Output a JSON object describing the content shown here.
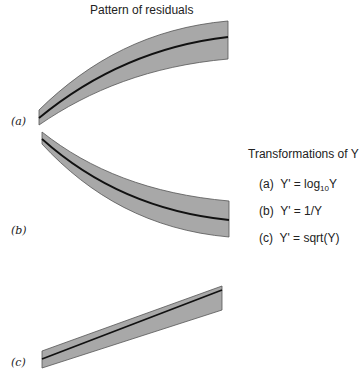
{
  "title": "Pattern of residuals",
  "panels": [
    {
      "id": "a",
      "label": "(a)",
      "shape": "concave-increasing band"
    },
    {
      "id": "b",
      "label": "(b)",
      "shape": "convex-decreasing band"
    },
    {
      "id": "c",
      "label": "(c)",
      "shape": "linear increasing widening band"
    }
  ],
  "transformations": {
    "title": "Transformations of Y",
    "items": [
      {
        "letter": "(a)",
        "lhs": "Y' = log",
        "sub": "10",
        "rhs": "Y"
      },
      {
        "letter": "(b)",
        "lhs": "Y' = 1/Y",
        "sub": "",
        "rhs": ""
      },
      {
        "letter": "(c)",
        "lhs": "Y' = sqrt(Y)",
        "sub": "",
        "rhs": ""
      }
    ]
  },
  "colors": {
    "band_fill": "#a8a8a8",
    "band_stroke": "#555555",
    "center_line": "#111111"
  }
}
